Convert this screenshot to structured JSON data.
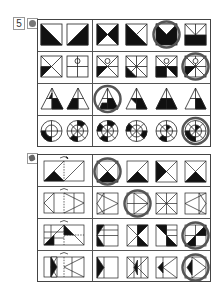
{
  "worksheet": {
    "question_number": "5",
    "section_a": {
      "icon": "apple-icon",
      "rows": [
        {
          "shape": "square",
          "given": 2,
          "options": 4,
          "answer_index": 2
        },
        {
          "shape": "square-with-circle",
          "given": 2,
          "options": 4,
          "answer_index": 3
        },
        {
          "shape": "triangle",
          "given": 2,
          "options": 4,
          "answer_index": 0
        },
        {
          "shape": "circle-target",
          "given": 2,
          "options": 4,
          "answer_index": 3
        }
      ]
    },
    "section_b": {
      "icon": "hand-pointer-icon",
      "rows": [
        {
          "shape": "fold-rectangle",
          "options": 4,
          "answer_index": 0
        },
        {
          "shape": "fold-rectangle-triangles",
          "options": 4,
          "answer_index": 1
        },
        {
          "shape": "fold-rectangle-black",
          "options": 4,
          "answer_index": 3
        },
        {
          "shape": "fold-rectangle-hourglass",
          "options": 4,
          "answer_index": 3
        }
      ]
    },
    "colors": {
      "ink": "#111111",
      "grid": "#444444",
      "answer_circle": "#555555",
      "paper": "#ffffff"
    }
  }
}
